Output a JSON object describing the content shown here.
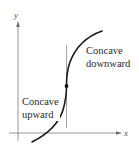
{
  "figure": {
    "type": "concavity-inflection-diagram",
    "axes": {
      "x_label": "x",
      "y_label": "y"
    },
    "regions": [
      {
        "id": "lower-left",
        "lines": [
          "Concave",
          "upward"
        ]
      },
      {
        "id": "upper-right",
        "lines": [
          "Concave",
          "downward"
        ]
      }
    ],
    "elements": {
      "curve": "S-shaped curve rising left to right",
      "inflection_point": "filled dot where concavity changes",
      "vertical_line": "vertical reference line through inflection point"
    },
    "colors": {
      "curve": "#1a1a1a",
      "axes": "#8a8a8a",
      "vertical_line": "#9a9a9a",
      "point": "#111111",
      "text": "#2a2a2a"
    }
  }
}
